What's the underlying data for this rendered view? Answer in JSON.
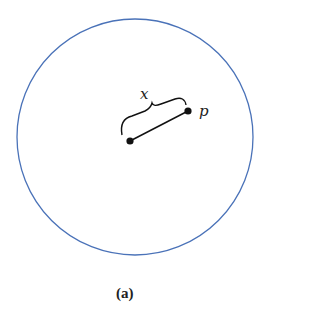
{
  "diagram": {
    "circle": {
      "cx": 135,
      "cy": 137,
      "r": 118,
      "stroke": "#4a72b8"
    },
    "center_point": {
      "x": 130,
      "y": 141
    },
    "point_p": {
      "x": 188,
      "y": 111,
      "label": "p"
    },
    "segment": {
      "label": "x"
    },
    "caption": "(a)"
  }
}
